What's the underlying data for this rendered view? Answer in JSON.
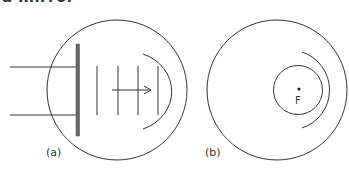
{
  "heading": "a mirror",
  "colors": {
    "stroke": "#333333",
    "plate": "#555555",
    "background": "#ffffff"
  },
  "panels": [
    {
      "label": "(a)",
      "description": "Plane wavefronts from a source plate travelling toward a concave arc inside a circle",
      "outer_circle": {
        "cx": 117,
        "cy": 90,
        "r": 70
      },
      "plate": {
        "x": 78,
        "y1": 44,
        "y2": 136
      },
      "input_lines_y": [
        67,
        115
      ],
      "wavefronts_x": [
        97,
        118,
        138,
        158
      ],
      "arrow": {
        "x1": 112,
        "x2": 151,
        "y": 90
      },
      "mirror_arc": "concave"
    },
    {
      "label": "(b)",
      "focus_label": "F",
      "description": "Circular wavefront around focus F with a concave arc inside a circle",
      "outer_circle": {
        "cx": 277,
        "cy": 90,
        "r": 70
      },
      "inner_circle": {
        "cx": 298,
        "cy": 90,
        "r": 24
      },
      "focus_point": {
        "x": 299,
        "y": 89
      }
    }
  ]
}
